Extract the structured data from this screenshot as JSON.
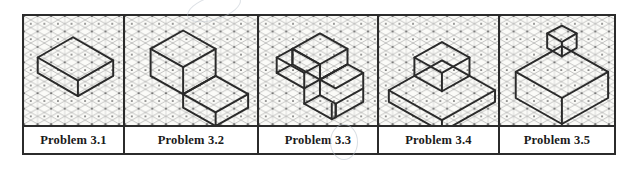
{
  "document": {
    "kind": "isometric-grid-problem-strip",
    "panel_count": 5,
    "paper_color": "#ffffff",
    "grid_paper_color": "#fbfbf8",
    "border_color": "#2b2b2b",
    "grid_line_color": "#8c8c8c",
    "grid_vertical_line_color": "#b5b5b5",
    "grid_dot_color": "#3a3a3a",
    "object_line_color": "#2a2a2a"
  },
  "panels": [
    {
      "id": "problem-3-1",
      "caption": "Problem 3.1",
      "object_name": "rectangular-slab",
      "description": "Flat rectangular block (slab) drawn in isometric, long axis receding to the right."
    },
    {
      "id": "problem-3-2",
      "caption": "Problem 3.2",
      "object_name": "l-shaped-block",
      "description": "L-shaped block: tall cube at the left with a low step extending to the lower right."
    },
    {
      "id": "problem-3-3",
      "caption": "Problem 3.3",
      "object_name": "z-shaped-block",
      "description": "Z / S shaped stepped block made of two offset rectangular prisms."
    },
    {
      "id": "problem-3-4",
      "caption": "Problem 3.4",
      "object_name": "cube-on-slab",
      "description": "Small cube centered on top of a wide flat rectangular slab."
    },
    {
      "id": "problem-3-5",
      "caption": "Problem 3.5",
      "object_name": "cube-with-small-cube-on-top",
      "description": "Large cube with a small cube centered on its top face."
    }
  ],
  "captions": {
    "p1": "Problem 3.1",
    "p2": "Problem 3.2",
    "p3": "Problem 3.3",
    "p4": "Problem 3.4",
    "p5": "Problem 3.5"
  }
}
